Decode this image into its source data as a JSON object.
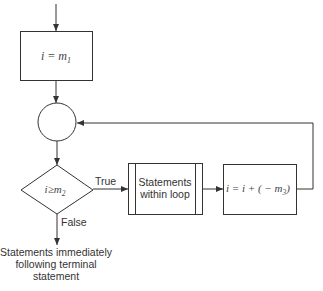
{
  "diagram": {
    "type": "flowchart",
    "title": "",
    "nodes": [
      {
        "id": "init",
        "shape": "rectangle",
        "label": "i = m",
        "subscript": "1"
      },
      {
        "id": "junction",
        "shape": "circle",
        "label": ""
      },
      {
        "id": "test",
        "shape": "diamond",
        "label": "i≥m",
        "subscript": "2"
      },
      {
        "id": "body",
        "shape": "predefined-process",
        "label_lines": [
          "Statements",
          "within loop"
        ]
      },
      {
        "id": "increment",
        "shape": "rectangle",
        "label": "i = i + ( − m",
        "subscript": "3",
        "suffix": ")"
      },
      {
        "id": "exit",
        "shape": "text",
        "label_lines": [
          "Statements immediately",
          "following terminal",
          "statement"
        ]
      }
    ],
    "edges": [
      {
        "from": "start",
        "to": "init",
        "label": ""
      },
      {
        "from": "init",
        "to": "junction",
        "label": ""
      },
      {
        "from": "junction",
        "to": "test",
        "label": ""
      },
      {
        "from": "test",
        "to": "body",
        "label": "True"
      },
      {
        "from": "body",
        "to": "increment",
        "label": ""
      },
      {
        "from": "increment",
        "to": "junction",
        "label": ""
      },
      {
        "from": "test",
        "to": "exit",
        "label": "False"
      }
    ],
    "edge_labels": {
      "true": "True",
      "false": "False"
    },
    "colors": {
      "line": "#333333",
      "background": "#ffffff"
    }
  }
}
